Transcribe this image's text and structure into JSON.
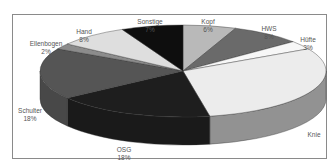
{
  "chart_data": {
    "type": "pie",
    "style": "3d-exploded-none",
    "title": "",
    "slices": [
      {
        "label": "Kopf",
        "value": 6,
        "pct_label": "6%",
        "color": "#b9b9b9"
      },
      {
        "label": "HWS",
        "value": 8,
        "pct_label": "8%",
        "color": "#6a6a6a"
      },
      {
        "label": "Hüfte",
        "value": 3,
        "pct_label": "3%",
        "color": "#f7f7f7"
      },
      {
        "label": "Knie",
        "value": 30,
        "pct_label": "",
        "color": "#ececec"
      },
      {
        "label": "OSG",
        "value": 18,
        "pct_label": "18%",
        "color": "#1e1e1e"
      },
      {
        "label": "Schulter",
        "value": 18,
        "pct_label": "18%",
        "color": "#555555"
      },
      {
        "label": "Ellenbogen",
        "value": 2,
        "pct_label": "2%",
        "color": "#8c8c8c"
      },
      {
        "label": "Hand",
        "value": 8,
        "pct_label": "8%",
        "color": "#dedede"
      },
      {
        "label": "Sonstige",
        "value": 7,
        "pct_label": "7%",
        "color": "#0e0e0e"
      }
    ],
    "legend": "none",
    "start_angle": "12 o'clock, clockwise"
  },
  "labels": {
    "kopf": {
      "name": "Kopf",
      "pct": "6%"
    },
    "hws": {
      "name": "HWS",
      "pct": "8%"
    },
    "huefte": {
      "name": "Hüfte",
      "pct": "3%"
    },
    "knie": {
      "name": "Knie",
      "pct": ""
    },
    "osg": {
      "name": "OSG",
      "pct": "18%"
    },
    "schulter": {
      "name": "Schulter",
      "pct": "18%"
    },
    "ellenbogen": {
      "name": "Ellenbogen",
      "pct": "2%"
    },
    "hand": {
      "name": "Hand",
      "pct": "8%"
    },
    "sonstige": {
      "name": "Sonstige",
      "pct": "7%"
    }
  }
}
